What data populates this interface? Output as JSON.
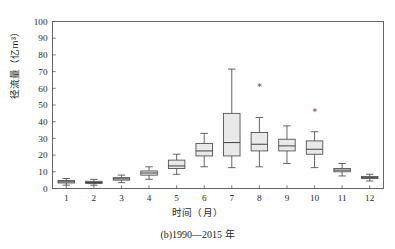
{
  "chart_data": {
    "type": "box",
    "title": "",
    "caption": "(b)1990—2015 年",
    "xlabel": "时间（月）",
    "ylabel": "径流量（亿m³）",
    "categories": [
      "1",
      "2",
      "3",
      "4",
      "5",
      "6",
      "7",
      "8",
      "9",
      "10",
      "11",
      "12"
    ],
    "xlim": [
      0.5,
      12.5
    ],
    "ylim": [
      0,
      100
    ],
    "yticks": [
      0,
      10,
      20,
      30,
      40,
      50,
      60,
      70,
      80,
      90,
      100
    ],
    "grid": false,
    "legend": null,
    "box_fill_color": "#e9e9e9",
    "box_line_color": "#4a4a4a",
    "boxes": [
      {
        "category": "1",
        "whisker_low": 2.0,
        "q1": 3.3,
        "median": 4.0,
        "q3": 4.8,
        "whisker_high": 6.0,
        "outliers": []
      },
      {
        "category": "2",
        "whisker_low": 2.0,
        "q1": 3.0,
        "median": 3.6,
        "q3": 4.3,
        "whisker_high": 5.5,
        "outliers": []
      },
      {
        "category": "3",
        "whisker_low": 3.5,
        "q1": 5.0,
        "median": 5.8,
        "q3": 6.5,
        "whisker_high": 8.0,
        "outliers": []
      },
      {
        "category": "4",
        "whisker_low": 5.5,
        "q1": 8.0,
        "median": 9.3,
        "q3": 10.5,
        "whisker_high": 13.0,
        "outliers": []
      },
      {
        "category": "5",
        "whisker_low": 8.5,
        "q1": 12.0,
        "median": 13.5,
        "q3": 17.0,
        "whisker_high": 20.5,
        "outliers": []
      },
      {
        "category": "6",
        "whisker_low": 13.0,
        "q1": 19.5,
        "median": 22.5,
        "q3": 27.0,
        "whisker_high": 33.0,
        "outliers": []
      },
      {
        "category": "7",
        "whisker_low": 12.5,
        "q1": 19.5,
        "median": 27.5,
        "q3": 45.0,
        "whisker_high": 71.5,
        "outliers": []
      },
      {
        "category": "8",
        "whisker_low": 13.0,
        "q1": 22.5,
        "median": 26.5,
        "q3": 33.5,
        "whisker_high": 42.5,
        "outliers": [
          62.5
        ]
      },
      {
        "category": "9",
        "whisker_low": 15.0,
        "q1": 22.5,
        "median": 25.5,
        "q3": 29.5,
        "whisker_high": 37.5,
        "outliers": []
      },
      {
        "category": "10",
        "whisker_low": 12.5,
        "q1": 20.5,
        "median": 23.5,
        "q3": 28.5,
        "whisker_high": 34.0,
        "outliers": [
          47.0
        ]
      },
      {
        "category": "11",
        "whisker_low": 7.5,
        "q1": 10.0,
        "median": 11.0,
        "q3": 12.0,
        "whisker_high": 15.0,
        "outliers": []
      },
      {
        "category": "12",
        "whisker_low": 4.5,
        "q1": 6.0,
        "median": 6.5,
        "q3": 7.2,
        "whisker_high": 8.5,
        "outliers": []
      }
    ]
  },
  "axis": {
    "ylabel": "径流量（亿m³）",
    "xlabel": "时间（月）",
    "ytick_labels": [
      "0",
      "10",
      "20",
      "30",
      "40",
      "50",
      "60",
      "70",
      "80",
      "90",
      "100"
    ],
    "xtick_labels": [
      "1",
      "2",
      "3",
      "4",
      "5",
      "6",
      "7",
      "8",
      "9",
      "10",
      "11",
      "12"
    ]
  },
  "caption": {
    "text": "(b)1990—2015 年"
  }
}
